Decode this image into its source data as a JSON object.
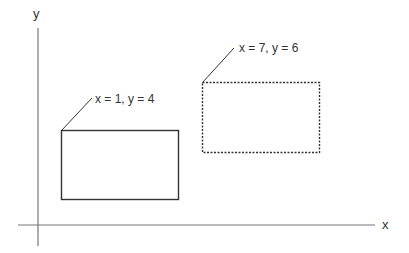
{
  "diagram": {
    "axes": {
      "x_label": "x",
      "y_label": "y",
      "color": "#777777"
    },
    "rectangles": [
      {
        "name": "solid-rectangle",
        "style": "solid",
        "label": "x = 1, y = 4",
        "color": "#333333"
      },
      {
        "name": "dashed-rectangle",
        "style": "dashed",
        "label": "x = 7, y = 6",
        "color": "#333333"
      }
    ]
  }
}
